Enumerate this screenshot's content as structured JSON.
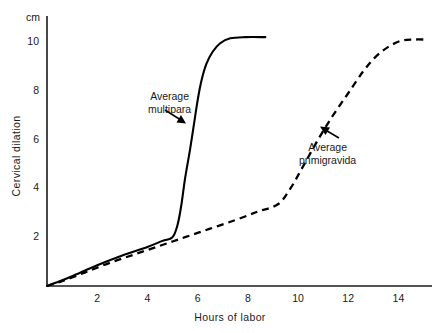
{
  "chart_data": {
    "type": "line",
    "title": "",
    "subtitle": "",
    "xlabel": "Hours of labor",
    "ylabel": "Cervical dilation",
    "yunit": "cm",
    "xlim": [
      0,
      15.2
    ],
    "ylim": [
      0,
      10.6
    ],
    "xticks": [
      "2",
      "4",
      "6",
      "8",
      "10",
      "12",
      "14"
    ],
    "xtick_values": [
      2,
      4,
      6,
      8,
      10,
      12,
      14
    ],
    "yticks": [
      "2",
      "4",
      "6",
      "8",
      "10"
    ],
    "ytick_values": [
      2,
      4,
      6,
      8,
      10
    ],
    "grid": false,
    "legend_position": "inline-annotations",
    "axis_color": "#1a1a1a",
    "series": [
      {
        "name": "Average multipara",
        "style": "solid",
        "color": "#000000",
        "annotation": {
          "line1": "Average",
          "line2": "multipara",
          "arrow": "down-right"
        },
        "points": [
          [
            0.0,
            0.0
          ],
          [
            0.4,
            0.15
          ],
          [
            1.0,
            0.4
          ],
          [
            2.0,
            0.85
          ],
          [
            3.0,
            1.25
          ],
          [
            4.0,
            1.6
          ],
          [
            4.6,
            1.85
          ],
          [
            5.0,
            2.0
          ],
          [
            5.2,
            2.5
          ],
          [
            5.35,
            3.3
          ],
          [
            5.5,
            4.4
          ],
          [
            5.7,
            5.6
          ],
          [
            5.85,
            6.6
          ],
          [
            6.0,
            7.6
          ],
          [
            6.15,
            8.4
          ],
          [
            6.35,
            9.1
          ],
          [
            6.6,
            9.6
          ],
          [
            6.9,
            9.95
          ],
          [
            7.3,
            10.15
          ],
          [
            7.9,
            10.2
          ],
          [
            8.7,
            10.2
          ]
        ]
      },
      {
        "name": "Average primigravida",
        "style": "dashed",
        "color": "#000000",
        "annotation": {
          "line1": "Average",
          "line2": "primigravida",
          "arrow": "up-left"
        },
        "points": [
          [
            0.0,
            0.0
          ],
          [
            0.6,
            0.2
          ],
          [
            1.5,
            0.55
          ],
          [
            2.5,
            0.95
          ],
          [
            3.5,
            1.3
          ],
          [
            4.5,
            1.65
          ],
          [
            5.5,
            2.0
          ],
          [
            6.5,
            2.35
          ],
          [
            7.5,
            2.7
          ],
          [
            8.4,
            3.05
          ],
          [
            9.2,
            3.35
          ],
          [
            9.7,
            4.0
          ],
          [
            10.2,
            4.9
          ],
          [
            10.8,
            6.0
          ],
          [
            11.4,
            7.0
          ],
          [
            12.0,
            7.9
          ],
          [
            12.6,
            8.8
          ],
          [
            13.1,
            9.4
          ],
          [
            13.6,
            9.8
          ],
          [
            14.1,
            10.05
          ],
          [
            14.6,
            10.1
          ],
          [
            15.1,
            10.1
          ]
        ]
      }
    ]
  }
}
